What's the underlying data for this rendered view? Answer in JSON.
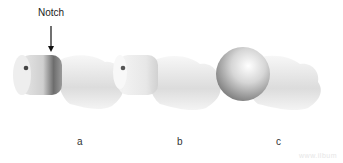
{
  "figure": {
    "annotation": "Notch",
    "panels": [
      {
        "id": "a",
        "label": "a",
        "description": "Femoral head with cylindrical reamed cap; arrow indicates notch"
      },
      {
        "id": "b",
        "label": "b",
        "description": "Femoral head with translucent cylindrical shell"
      },
      {
        "id": "c",
        "label": "c",
        "description": "Femoral head with spherical component"
      }
    ],
    "watermark": "www.ilbum"
  },
  "colors": {
    "background": "#ffffff",
    "bone_light": "#f2f2f2",
    "bone_shade": "#bdbdbd",
    "cap_dark": "#6a6a6a",
    "text": "#222222"
  }
}
